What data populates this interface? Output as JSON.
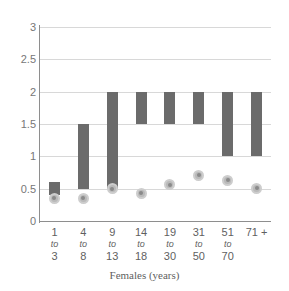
{
  "chart_data": {
    "type": "bar",
    "title": "",
    "subtitle": "",
    "xlabel": "Females (years)",
    "ylabel": "",
    "ylim": [
      0,
      3
    ],
    "ytick_step": 0.5,
    "yticks": [
      "0",
      "0.5",
      "1",
      "1.5",
      "2",
      "2.5",
      "3"
    ],
    "ytick_values": [
      0,
      0.5,
      1,
      1.5,
      2,
      2.5,
      3
    ],
    "grid": true,
    "legend": "none",
    "categories": [
      "1 to 3",
      "4 to 8",
      "9 to 13",
      "14 to 18",
      "19 to 30",
      "31 to 50",
      "51 to 70",
      "71 +"
    ],
    "category_parts": [
      {
        "lo": "1",
        "to": "to",
        "hi": "3"
      },
      {
        "lo": "4",
        "to": "to",
        "hi": "8"
      },
      {
        "lo": "9",
        "to": "to",
        "hi": "13"
      },
      {
        "lo": "14",
        "to": "to",
        "hi": "18"
      },
      {
        "lo": "19",
        "to": "to",
        "hi": "30"
      },
      {
        "lo": "31",
        "to": "to",
        "hi": "50"
      },
      {
        "lo": "51",
        "to": "to",
        "hi": "70"
      },
      {
        "lo": "71 +",
        "to": "",
        "hi": ""
      }
    ],
    "series": [
      {
        "name": "range-bar",
        "type": "floating-bar",
        "color": "#6b6b6b",
        "low": [
          0.4,
          0.5,
          0.5,
          1.5,
          1.5,
          1.5,
          1.0,
          1.0
        ],
        "high": [
          0.6,
          1.5,
          2.0,
          2.0,
          2.0,
          2.0,
          2.0,
          2.0
        ]
      },
      {
        "name": "marker",
        "type": "scatter",
        "color": "#b9b9b9",
        "values": [
          0.35,
          0.35,
          0.5,
          0.43,
          0.56,
          0.71,
          0.63,
          0.51
        ]
      }
    ]
  },
  "colors": {
    "bar": "#6b6b6b",
    "marker_fill": "#b9b9b9",
    "marker_ring": "#cdcdcd",
    "marker_core": "#8a8a8a",
    "gridline": "#d8d8d8",
    "axis": "#8e8e8e",
    "tick_text": "#777777",
    "background": "#ffffff"
  }
}
